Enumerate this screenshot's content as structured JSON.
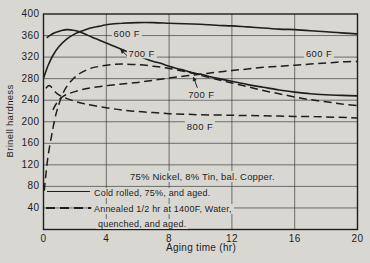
{
  "page": {
    "bg_color": "#d9d7d2",
    "ink_color": "#1e1e1e",
    "grid_color": "#3f3f3f"
  },
  "chart_data": {
    "type": "line",
    "title": "",
    "xlabel": "Aging time (hr)",
    "ylabel": "Brinell hardness",
    "xlim": [
      0,
      20
    ],
    "ylim": [
      0,
      400
    ],
    "xticks": [
      0,
      4,
      8,
      12,
      16,
      20
    ],
    "yticks": [
      40,
      80,
      120,
      160,
      200,
      240,
      280,
      320,
      360,
      400
    ],
    "grid": true,
    "annotation": "75% Nickel, 8% Tin, bal. Copper.",
    "legend": {
      "position": "inside-bottom-left",
      "entries": [
        {
          "style": "solid",
          "lines": [
            "Cold rolled, 75%, and aged."
          ]
        },
        {
          "style": "dashed",
          "lines": [
            "Annealed 1/2 hr at 1400F, Water,",
            "quenched, and aged."
          ]
        }
      ]
    },
    "curve_labels": [
      {
        "text": "600 F",
        "x": 5.3,
        "y": 365.5
      },
      {
        "text": "700 F",
        "x": 6.25,
        "y": 328,
        "arrow_from": [
          5.35,
          322
        ],
        "arrow_to": [
          4.9,
          334
        ]
      },
      {
        "text": "600 F",
        "x": 17.55,
        "y": 327
      },
      {
        "text": "700 F",
        "x": 10.05,
        "y": 251,
        "arrow_from": [
          9.8,
          263
        ],
        "arrow_to": [
          9.55,
          283
        ]
      },
      {
        "text": "800 F",
        "x": 9.97,
        "y": 192
      }
    ],
    "series": [
      {
        "name": "600 F (cold rolled)",
        "style": "solid",
        "points": [
          [
            0,
            281
          ],
          [
            0.3,
            305
          ],
          [
            0.6,
            323
          ],
          [
            1,
            340
          ],
          [
            1.5,
            354
          ],
          [
            2,
            363
          ],
          [
            2.5,
            369
          ],
          [
            3,
            374
          ],
          [
            3.5,
            377
          ],
          [
            4,
            380
          ],
          [
            4.5,
            382
          ],
          [
            5,
            383
          ],
          [
            6,
            384
          ],
          [
            7,
            384
          ],
          [
            8,
            383
          ],
          [
            9,
            382
          ],
          [
            10,
            381
          ],
          [
            11,
            379
          ],
          [
            12,
            378
          ],
          [
            13,
            376
          ],
          [
            14,
            374
          ],
          [
            15,
            372
          ],
          [
            16,
            371
          ],
          [
            17,
            369
          ],
          [
            18,
            367
          ],
          [
            19,
            365
          ],
          [
            20,
            363
          ]
        ]
      },
      {
        "name": "700 F (cold rolled)",
        "style": "solid",
        "points": [
          [
            0.2,
            356
          ],
          [
            0.5,
            362
          ],
          [
            0.8,
            366
          ],
          [
            1.1,
            369
          ],
          [
            1.5,
            371
          ],
          [
            1.9,
            370
          ],
          [
            2.3,
            367
          ],
          [
            2.7,
            362
          ],
          [
            3.1,
            357
          ],
          [
            3.6,
            351
          ],
          [
            4,
            346
          ],
          [
            4.5,
            340
          ],
          [
            5,
            334
          ],
          [
            5.5,
            328
          ],
          [
            6,
            323
          ],
          [
            6.5,
            317
          ],
          [
            7,
            312
          ],
          [
            7.5,
            308
          ],
          [
            8,
            303
          ],
          [
            8.5,
            299
          ],
          [
            9,
            295
          ],
          [
            9.5,
            291
          ],
          [
            10,
            288
          ],
          [
            11,
            281
          ],
          [
            12,
            275
          ],
          [
            13,
            269
          ],
          [
            14,
            264
          ],
          [
            15,
            259
          ],
          [
            16,
            255
          ],
          [
            17,
            252
          ],
          [
            18,
            250
          ],
          [
            19,
            249
          ],
          [
            20,
            248
          ]
        ]
      },
      {
        "name": "600 F (annealed)",
        "style": "dashed",
        "points": [
          [
            0.6,
            222
          ],
          [
            0.8,
            233
          ],
          [
            1,
            241
          ],
          [
            1.3,
            248
          ],
          [
            1.6,
            252
          ],
          [
            2,
            256
          ],
          [
            2.5,
            260
          ],
          [
            3,
            263
          ],
          [
            4,
            267
          ],
          [
            5,
            270
          ],
          [
            6,
            273
          ],
          [
            7,
            277
          ],
          [
            8,
            281
          ],
          [
            9,
            285
          ],
          [
            10,
            288
          ],
          [
            11,
            292
          ],
          [
            12,
            295
          ],
          [
            13,
            298
          ],
          [
            14,
            301
          ],
          [
            15,
            303
          ],
          [
            16,
            305
          ],
          [
            17,
            307
          ],
          [
            18,
            309
          ],
          [
            19,
            311
          ],
          [
            20,
            312
          ]
        ]
      },
      {
        "name": "700 F (annealed)",
        "style": "dashed",
        "points": [
          [
            0.05,
            72
          ],
          [
            0.15,
            102
          ],
          [
            0.3,
            138
          ],
          [
            0.5,
            172
          ],
          [
            0.7,
            202
          ],
          [
            0.9,
            225
          ],
          [
            1.2,
            250
          ],
          [
            1.5,
            266
          ],
          [
            1.9,
            280
          ],
          [
            2.4,
            291
          ],
          [
            3,
            299
          ],
          [
            3.6,
            303
          ],
          [
            4.3,
            306
          ],
          [
            5,
            307
          ],
          [
            6,
            306
          ],
          [
            7,
            303
          ],
          [
            8,
            299
          ],
          [
            9,
            293
          ],
          [
            9.5,
            290
          ],
          [
            10,
            286
          ],
          [
            11,
            279
          ],
          [
            12,
            272
          ],
          [
            13,
            265
          ],
          [
            14,
            258
          ],
          [
            15,
            252
          ],
          [
            16,
            246
          ],
          [
            17,
            241
          ],
          [
            18,
            237
          ],
          [
            19,
            233
          ],
          [
            20,
            230
          ]
        ]
      },
      {
        "name": "800 F (annealed)",
        "style": "dashed",
        "points": [
          [
            0.15,
            262
          ],
          [
            0.4,
            267
          ],
          [
            0.8,
            254
          ],
          [
            1.1,
            248
          ],
          [
            1.5,
            243
          ],
          [
            2,
            238
          ],
          [
            2.5,
            234
          ],
          [
            3,
            231
          ],
          [
            4,
            226
          ],
          [
            5,
            222
          ],
          [
            6,
            219
          ],
          [
            7,
            217
          ],
          [
            8,
            215
          ],
          [
            9,
            214
          ],
          [
            10,
            213
          ],
          [
            12,
            212
          ],
          [
            14,
            211
          ],
          [
            16,
            210
          ],
          [
            18,
            209
          ],
          [
            20,
            207
          ]
        ]
      }
    ]
  }
}
